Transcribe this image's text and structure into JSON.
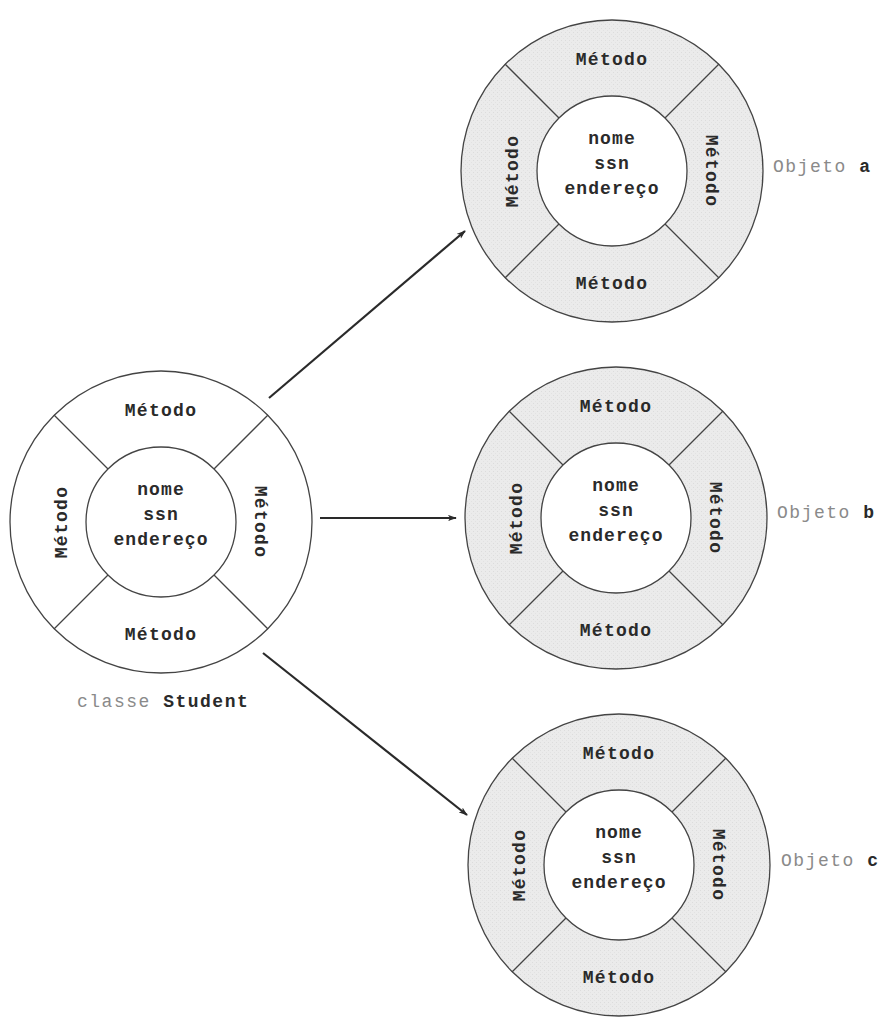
{
  "colors": {
    "stroke": "#444444",
    "class_fill": "#ffffff",
    "object_fill": "#ebebeb",
    "inner_fill": "#ffffff",
    "label_light": "#8a8a8a",
    "text_dark": "#2a2a2a"
  },
  "class_node": {
    "label_prefix": "classe",
    "label_name": "Student",
    "methods": {
      "top": "Método",
      "right": "Método",
      "bottom": "Método",
      "left": "Método"
    },
    "attributes": [
      "nome",
      "ssn",
      "endereço"
    ]
  },
  "objects": [
    {
      "label_prefix": "Objeto",
      "label_name": "a",
      "methods": {
        "top": "Método",
        "right": "Método",
        "bottom": "Método",
        "left": "Método"
      },
      "attributes": [
        "nome",
        "ssn",
        "endereço"
      ]
    },
    {
      "label_prefix": "Objeto",
      "label_name": "b",
      "methods": {
        "top": "Método",
        "right": "Método",
        "bottom": "Método",
        "left": "Método"
      },
      "attributes": [
        "nome",
        "ssn",
        "endereço"
      ]
    },
    {
      "label_prefix": "Objeto",
      "label_name": "c",
      "methods": {
        "top": "Método",
        "right": "Método",
        "bottom": "Método",
        "left": "Método"
      },
      "attributes": [
        "nome",
        "ssn",
        "endereço"
      ]
    }
  ],
  "arrows": [
    {
      "from": "classe Student",
      "to": "Objeto a"
    },
    {
      "from": "classe Student",
      "to": "Objeto b"
    },
    {
      "from": "classe Student",
      "to": "Objeto c"
    }
  ]
}
